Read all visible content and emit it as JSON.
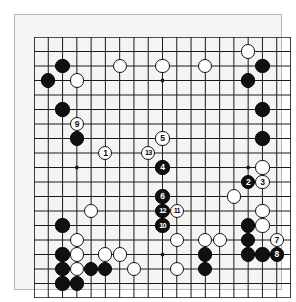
{
  "diagram": {
    "kind": "go-board-diagram",
    "board_size": 19,
    "title": "",
    "caption": "",
    "colors": {
      "board_background": "#f4f4f2",
      "grid_line": "#1a1a1a",
      "black_stone": "#101010",
      "white_stone": "#ffffff",
      "frame": "#b9b9b4"
    },
    "star_points": [
      {
        "col": 4,
        "row": 4
      },
      {
        "col": 10,
        "row": 4
      },
      {
        "col": 16,
        "row": 4
      },
      {
        "col": 4,
        "row": 10
      },
      {
        "col": 10,
        "row": 10
      },
      {
        "col": 16,
        "row": 10
      },
      {
        "col": 4,
        "row": 16
      },
      {
        "col": 10,
        "row": 16
      },
      {
        "col": 16,
        "row": 16
      }
    ],
    "stones": [
      {
        "col": 3,
        "row": 3,
        "color": "black",
        "label": ""
      },
      {
        "col": 2,
        "row": 4,
        "color": "black",
        "label": ""
      },
      {
        "col": 4,
        "row": 4,
        "color": "white",
        "label": ""
      },
      {
        "col": 7,
        "row": 3,
        "color": "white",
        "label": ""
      },
      {
        "col": 10,
        "row": 3,
        "color": "white",
        "label": ""
      },
      {
        "col": 13,
        "row": 3,
        "color": "white",
        "label": ""
      },
      {
        "col": 16,
        "row": 2,
        "color": "white",
        "label": ""
      },
      {
        "col": 17,
        "row": 3,
        "color": "black",
        "label": ""
      },
      {
        "col": 16,
        "row": 4,
        "color": "black",
        "label": ""
      },
      {
        "col": 3,
        "row": 6,
        "color": "black",
        "label": ""
      },
      {
        "col": 17,
        "row": 6,
        "color": "black",
        "label": ""
      },
      {
        "col": 4,
        "row": 7,
        "color": "white",
        "label": "9"
      },
      {
        "col": 4,
        "row": 8,
        "color": "black",
        "label": ""
      },
      {
        "col": 10,
        "row": 8,
        "color": "white",
        "label": "5"
      },
      {
        "col": 17,
        "row": 8,
        "color": "black",
        "label": ""
      },
      {
        "col": 6,
        "row": 9,
        "color": "white",
        "label": "1"
      },
      {
        "col": 9,
        "row": 9,
        "color": "white",
        "label": "13"
      },
      {
        "col": 10,
        "row": 10,
        "color": "black",
        "label": "4"
      },
      {
        "col": 17,
        "row": 10,
        "color": "white",
        "label": ""
      },
      {
        "col": 16,
        "row": 11,
        "color": "black",
        "label": "2"
      },
      {
        "col": 17,
        "row": 11,
        "color": "white",
        "label": "3"
      },
      {
        "col": 10,
        "row": 12,
        "color": "black",
        "label": "6"
      },
      {
        "col": 15,
        "row": 12,
        "color": "white",
        "label": ""
      },
      {
        "col": 5,
        "row": 13,
        "color": "white",
        "label": ""
      },
      {
        "col": 10,
        "row": 13,
        "color": "black",
        "label": "12"
      },
      {
        "col": 11,
        "row": 13,
        "color": "white",
        "label": "11"
      },
      {
        "col": 17,
        "row": 13,
        "color": "white",
        "label": ""
      },
      {
        "col": 3,
        "row": 14,
        "color": "black",
        "label": ""
      },
      {
        "col": 10,
        "row": 14,
        "color": "black",
        "label": "10"
      },
      {
        "col": 16,
        "row": 14,
        "color": "black",
        "label": ""
      },
      {
        "col": 17,
        "row": 14,
        "color": "white",
        "label": ""
      },
      {
        "col": 4,
        "row": 15,
        "color": "white",
        "label": ""
      },
      {
        "col": 11,
        "row": 15,
        "color": "white",
        "label": ""
      },
      {
        "col": 13,
        "row": 15,
        "color": "white",
        "label": ""
      },
      {
        "col": 14,
        "row": 15,
        "color": "white",
        "label": ""
      },
      {
        "col": 16,
        "row": 15,
        "color": "black",
        "label": ""
      },
      {
        "col": 18,
        "row": 15,
        "color": "white",
        "label": "7"
      },
      {
        "col": 3,
        "row": 16,
        "color": "black",
        "label": ""
      },
      {
        "col": 4,
        "row": 16,
        "color": "white",
        "label": ""
      },
      {
        "col": 6,
        "row": 16,
        "color": "white",
        "label": ""
      },
      {
        "col": 7,
        "row": 16,
        "color": "white",
        "label": ""
      },
      {
        "col": 13,
        "row": 16,
        "color": "black",
        "label": ""
      },
      {
        "col": 16,
        "row": 16,
        "color": "black",
        "label": ""
      },
      {
        "col": 17,
        "row": 16,
        "color": "black",
        "label": ""
      },
      {
        "col": 18,
        "row": 16,
        "color": "black",
        "label": "8"
      },
      {
        "col": 3,
        "row": 17,
        "color": "black",
        "label": ""
      },
      {
        "col": 4,
        "row": 17,
        "color": "white",
        "label": ""
      },
      {
        "col": 5,
        "row": 17,
        "color": "black",
        "label": ""
      },
      {
        "col": 6,
        "row": 17,
        "color": "black",
        "label": ""
      },
      {
        "col": 8,
        "row": 17,
        "color": "white",
        "label": ""
      },
      {
        "col": 11,
        "row": 17,
        "color": "white",
        "label": ""
      },
      {
        "col": 13,
        "row": 17,
        "color": "black",
        "label": ""
      },
      {
        "col": 3,
        "row": 18,
        "color": "black",
        "label": ""
      },
      {
        "col": 4,
        "row": 18,
        "color": "black",
        "label": ""
      }
    ],
    "move_numbers": [
      {
        "number": "1",
        "color": "white",
        "col": 6,
        "row": 9
      },
      {
        "number": "2",
        "color": "black",
        "col": 16,
        "row": 11
      },
      {
        "number": "3",
        "color": "white",
        "col": 17,
        "row": 11
      },
      {
        "number": "4",
        "color": "black",
        "col": 10,
        "row": 10
      },
      {
        "number": "5",
        "color": "white",
        "col": 10,
        "row": 8
      },
      {
        "number": "6",
        "color": "black",
        "col": 10,
        "row": 12
      },
      {
        "number": "7",
        "color": "white",
        "col": 18,
        "row": 15
      },
      {
        "number": "8",
        "color": "black",
        "col": 18,
        "row": 16
      },
      {
        "number": "9",
        "color": "white",
        "col": 4,
        "row": 7
      },
      {
        "number": "10",
        "color": "black",
        "col": 10,
        "row": 14
      },
      {
        "number": "11",
        "color": "white",
        "col": 11,
        "row": 13
      },
      {
        "number": "12",
        "color": "black",
        "col": 10,
        "row": 13
      },
      {
        "number": "13",
        "color": "white",
        "col": 9,
        "row": 9
      }
    ]
  }
}
